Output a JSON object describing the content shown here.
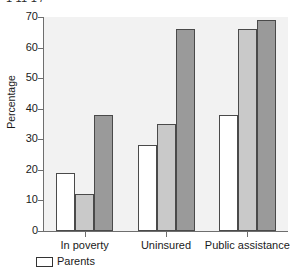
{
  "top_fragment": "1 11 1 /",
  "legend": {
    "entries": [
      {
        "label": "Parents",
        "swatch": "white"
      }
    ]
  },
  "chart_data": {
    "type": "bar",
    "title": "",
    "xlabel": "",
    "ylabel": "Percentage",
    "ylim": [
      0,
      70
    ],
    "yticks": [
      0,
      10,
      20,
      30,
      40,
      50,
      60,
      70
    ],
    "ytick_labels": [
      "0",
      "10",
      "20",
      "30",
      "40",
      "50",
      "60",
      "70"
    ],
    "grid": false,
    "legend_position": "bottom-left",
    "categories": [
      "In poverty",
      "Uninsured",
      "Public assistance"
    ],
    "series": [
      {
        "name": "Parents",
        "color": "#ffffff",
        "values": [
          19,
          28,
          38
        ]
      },
      {
        "name": "series-2",
        "color": "#c9c9c9",
        "values": [
          12,
          35,
          66
        ]
      },
      {
        "name": "series-3",
        "color": "#9a9a9a",
        "values": [
          38,
          66,
          69
        ]
      }
    ]
  }
}
